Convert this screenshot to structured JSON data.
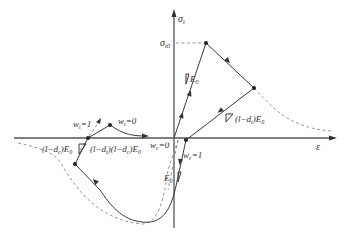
{
  "diagram": {
    "type": "stress-strain hysteresis (concrete damage plasticity)",
    "axes": {
      "y_label": "σ_t",
      "y_label_main": "σ",
      "y_label_sub": "t",
      "x_label": "ε"
    },
    "peak": {
      "label_main": "σ",
      "label_sub": "t0"
    },
    "labels": {
      "e0_tension": {
        "main": "E",
        "sub": "0"
      },
      "unload_tension": {
        "prefix": "(l−d",
        "sub": "t",
        "suffix": ")E",
        "sub2": "0"
      },
      "unload_compression_left": {
        "prefix": "(l−d",
        "sub": "c",
        "suffix": ")E",
        "sub2": "0"
      },
      "reload_combined": {
        "text": "(l−d",
        "sub": "t",
        "mid": ")(l−d",
        "sub_c": "c",
        "suffix": ")E",
        "sub2": "0"
      },
      "wt1": {
        "main": "w",
        "sub": "t",
        "eq": "=1"
      },
      "wt0": {
        "main": "w",
        "sub": "t",
        "eq": "=0"
      },
      "wc0": {
        "main": "w",
        "sub": "c",
        "eq": "=0"
      },
      "wc1": {
        "main": "w",
        "sub": "c",
        "eq": "=1"
      },
      "e0_compression": {
        "main": "E",
        "sub": "0"
      }
    },
    "colors": {
      "solid_curve": "#3a3a3a",
      "dashed_curve": "#8a8a8a",
      "axis": "#555555"
    }
  }
}
